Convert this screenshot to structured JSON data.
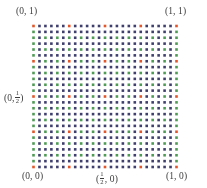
{
  "figure": {
    "labels": {
      "top_left": "(0, 1)",
      "top_right": "(1, 1)",
      "bottom_left": "(0, 0)",
      "bottom_right": "(1, 0)",
      "left_mid_prefix": "(0,",
      "left_mid_num": "1",
      "left_mid_den": "2",
      "left_mid_suffix": ")",
      "bottom_mid_prefix": "(",
      "bottom_mid_num": "1",
      "bottom_mid_den": "2",
      "bottom_mid_suffix": ", 0)"
    }
  },
  "chart_data": {
    "type": "scatter",
    "title": "",
    "xlabel": "",
    "ylabel": "",
    "xlim": [
      0,
      1
    ],
    "ylim": [
      0,
      1
    ],
    "grid": false,
    "legend": "none",
    "n_cols": 25,
    "n_rows": 25,
    "dot_size_px": 2.6,
    "colors": {
      "navy": "#3f3f6e",
      "green": "#4e9b54",
      "red": "#e2562a",
      "background": "#ffffff"
    },
    "rules": {
      "boundary_top_bottom": "navy",
      "boundary_left_right": "green",
      "interior_even_even": "green",
      "interior_other": "navy",
      "red_indices": [
        0,
        6,
        12,
        18,
        24
      ],
      "red_at": "both index in red_indices"
    },
    "x_tick_labels": [
      "(0, 0)",
      "(1/2, 0)",
      "(1, 0)"
    ],
    "x_tick_values": [
      0,
      0.5,
      1
    ],
    "y_tick_labels": [
      "(0, 0)",
      "(0, 1/2)",
      "(0, 1)"
    ],
    "y_tick_values": [
      0,
      0.5,
      1
    ]
  }
}
